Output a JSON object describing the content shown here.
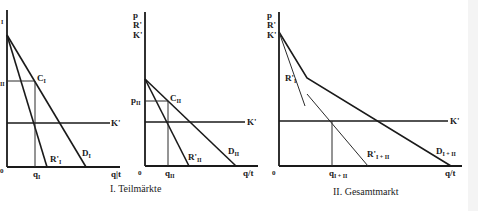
{
  "figure": {
    "panels": [
      {
        "id": "panel-1",
        "y_axis_labels": [
          "p",
          "R'",
          "K'"
        ],
        "origin": "0",
        "x_axis_label": "q|t",
        "price_label": "p",
        "price_sub": "I",
        "point_label": "C",
        "point_sub": "I",
        "quantity_label": "q",
        "quantity_sub": "I",
        "demand_label": "D",
        "demand_sub": "I",
        "mr_label": "R'",
        "mr_sub": "I",
        "mc_label": "K'"
      },
      {
        "id": "panel-2",
        "y_axis_labels": [
          "p",
          "R'",
          "K'"
        ],
        "origin": "0",
        "x_axis_label": "q/t",
        "price_label": "p",
        "price_sub": "II",
        "point_label": "C",
        "point_sub": "II",
        "quantity_label": "q",
        "quantity_sub": "II",
        "demand_label": "D",
        "demand_sub": "II",
        "mr_label": "R'",
        "mr_sub": "II",
        "mc_label": "K'"
      },
      {
        "id": "panel-3",
        "y_axis_labels": [
          "p",
          "R'",
          "K'"
        ],
        "origin": "0",
        "x_axis_label": "q/t",
        "quantity_label": "q",
        "quantity_sub": "I + II",
        "demand_label": "D",
        "demand_sub": "I + II",
        "mr_label": "R'",
        "mr_sub": "I + II",
        "mr1_label": "R'",
        "mr1_sub": "I",
        "mc_label": "K'"
      }
    ],
    "captions": {
      "left": "I. Teilmärkte",
      "right": "II. Gesamtmarkt"
    }
  }
}
